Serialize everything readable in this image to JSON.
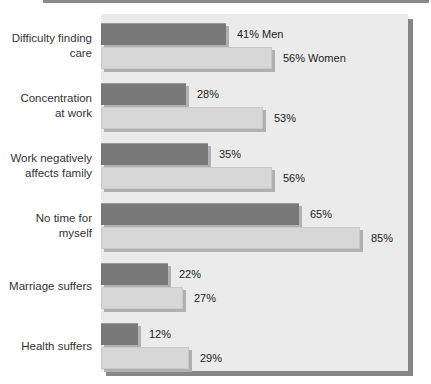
{
  "chart_data": {
    "type": "bar",
    "orientation": "horizontal",
    "title": "",
    "xlabel": "",
    "ylabel": "",
    "xlim": [
      0,
      100
    ],
    "grid": false,
    "legend": "inline labels on first row bars",
    "categories": [
      "Difficulty finding care",
      "Concentration at work",
      "Work negatively affects family",
      "No time for myself",
      "Marriage suffers",
      "Health suffers"
    ],
    "category_lines": [
      [
        "Difficulty finding",
        "care"
      ],
      [
        "Concentration",
        "at work"
      ],
      [
        "Work negatively",
        "affects family"
      ],
      [
        "No time for",
        "myself"
      ],
      [
        "Marriage suffers"
      ],
      [
        "Health suffers"
      ]
    ],
    "series": [
      {
        "name": "Men",
        "values": [
          41,
          28,
          35,
          65,
          22,
          12
        ],
        "labels": [
          "41% Men",
          "28%",
          "35%",
          "65%",
          "22%",
          "12%"
        ],
        "color": "#787878"
      },
      {
        "name": "Women",
        "values": [
          56,
          53,
          56,
          85,
          27,
          29
        ],
        "labels": [
          "56% Women",
          "53%",
          "56%",
          "85%",
          "27%",
          "29%"
        ],
        "color": "#d7d7d7"
      }
    ],
    "plot_background": "#ebebeb",
    "panel_shadow_color": "#868686"
  },
  "colors": {
    "page_bg": "#ffffff",
    "top_rule": "#8a8a8a",
    "category_text": "#333333",
    "value_text": "#1a1a1a",
    "bar_shadow": "#b0b0b0",
    "women_bar_edge": "#c9c9c9"
  }
}
